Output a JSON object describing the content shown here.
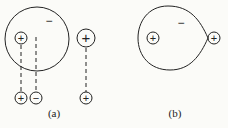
{
  "diagram": {
    "panel_a": {
      "label": "(a)",
      "large_circle": {
        "charge": "−"
      },
      "inner_charge": "+",
      "separate_charge": "+",
      "bottom_charges": [
        "+",
        "−",
        "+"
      ]
    },
    "panel_b": {
      "label": "(b)",
      "teardrop_charge": "−",
      "inner_charge": "+",
      "tip_charge": "+"
    }
  },
  "colors": {
    "stroke": "#222222",
    "background": "#fbfbf8"
  }
}
